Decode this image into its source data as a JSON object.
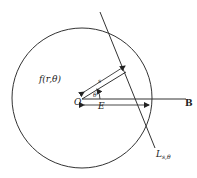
{
  "diagram": {
    "function_label": "f(r,θ)",
    "origin_label": "O",
    "theta_label": "θ",
    "s_label": "s",
    "e_label": "E",
    "b_label": "B",
    "line_label_main": "L",
    "line_label_sub": "s,θ"
  }
}
